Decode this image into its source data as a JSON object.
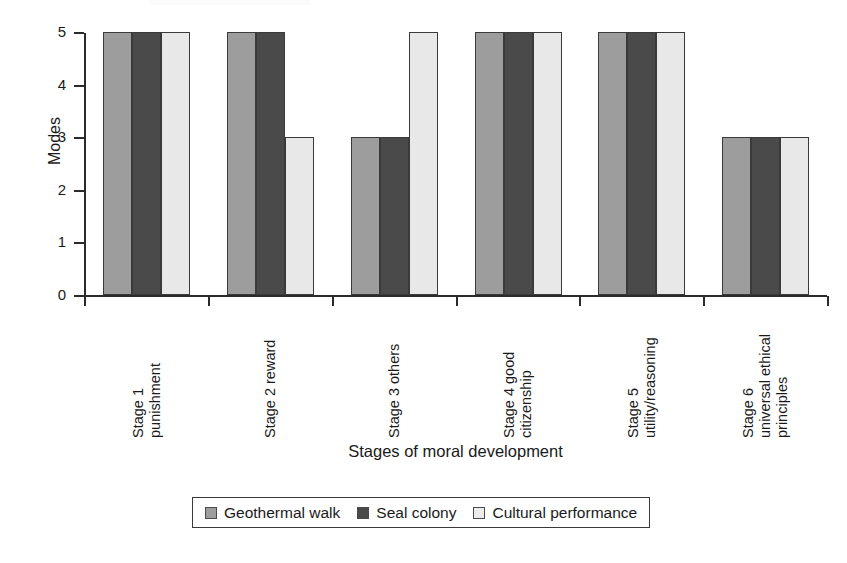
{
  "chart_data": {
    "type": "bar",
    "title": "",
    "xlabel": "Stages of moral development",
    "ylabel": "Modes",
    "categories": [
      "Stage 1 punishment",
      "Stage 2 reward",
      "Stage 3 others",
      "Stage 4 good citizenship",
      "Stage 5 utility/reasoning",
      "Stage 6 universal ethical principles"
    ],
    "category_lines": [
      [
        "Stage 1",
        "punishment"
      ],
      [
        "Stage 2 reward"
      ],
      [
        "Stage 3 others"
      ],
      [
        "Stage 4 good",
        "citizenship"
      ],
      [
        "Stage 5",
        "utility/reasoning"
      ],
      [
        "Stage 6",
        "universal ethical",
        "principles"
      ]
    ],
    "series": [
      {
        "name": "Geothermal walk",
        "color": "#9d9d9d",
        "values": [
          5,
          5,
          3,
          5,
          5,
          3
        ]
      },
      {
        "name": "Seal colony",
        "color": "#4a4a4a",
        "values": [
          5,
          5,
          3,
          5,
          5,
          3
        ]
      },
      {
        "name": "Cultural performance",
        "color": "#e8e8e8",
        "values": [
          5,
          3,
          5,
          5,
          5,
          3
        ]
      }
    ],
    "ylim": [
      0,
      5
    ],
    "yticks": [
      0,
      1,
      2,
      3,
      4,
      5
    ],
    "ytick_labels": [
      "0",
      "1",
      "2",
      "3",
      "4",
      "5"
    ],
    "grid": false,
    "legend_position": "bottom-center"
  },
  "axes": {
    "y_title": "Modes",
    "x_title": "Stages of moral development"
  },
  "legend": {
    "items": [
      {
        "label": "Geothermal walk"
      },
      {
        "label": "Seal colony"
      },
      {
        "label": "Cultural performance"
      }
    ]
  }
}
